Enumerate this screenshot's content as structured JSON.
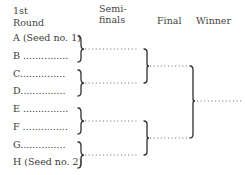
{
  "headers": {
    "round1_line1": "1st",
    "round1_line2": "Round",
    "semis_line1": "Semi-",
    "semis_line2": "finals",
    "final": "Final",
    "winner": "Winner"
  },
  "entrants": [
    {
      "label": "A (Seed no. 1)"
    },
    {
      "label": "B ..............."
    },
    {
      "label": "C..............."
    },
    {
      "label": "D..............."
    },
    {
      "label": "E ..............."
    },
    {
      "label": "F ..............."
    },
    {
      "label": "G..............."
    },
    {
      "label": "H (Seed no. 2)"
    }
  ],
  "colors": {
    "ink": "#3a3a3a",
    "dots": "#666666",
    "background": "#ffffff"
  }
}
